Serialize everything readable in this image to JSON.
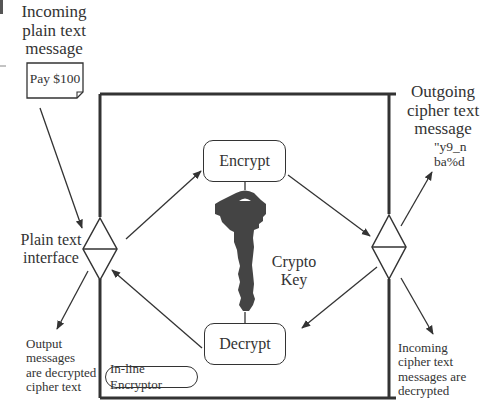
{
  "diagram": {
    "title": "In-line Encryptor",
    "incoming_plain": {
      "line1": "Incoming",
      "line2": "plain text",
      "line3": "message"
    },
    "note_card": "Pay $100",
    "outgoing_cipher": {
      "line1": "Outgoing",
      "line2": "cipher text",
      "line3": "message"
    },
    "cipher_sample": {
      "line1": "\"y9_n",
      "line2": "ba%d"
    },
    "plain_interface": {
      "line1": "Plain text",
      "line2": "interface"
    },
    "encrypt_label": "Encrypt",
    "decrypt_label": "Decrypt",
    "key_label": {
      "line1": "Crypto",
      "line2": "Key"
    },
    "output_note": {
      "line1": "Output",
      "line2": "messages",
      "line3": "are decrypted",
      "line4": "cipher text"
    },
    "incoming_cipher_note": {
      "line1": "Incoming",
      "line2": "cipher text",
      "line3": "messages are",
      "line4": "decrypted"
    },
    "enclosure_label": "In-line Encryptor"
  },
  "colors": {
    "line": "#333333",
    "key_fill": "#444444",
    "background": "#ffffff"
  }
}
